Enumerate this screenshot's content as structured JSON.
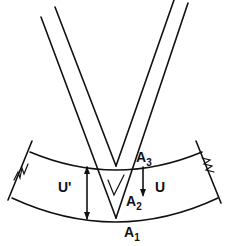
{
  "diagram": {
    "type": "indentation-geometry",
    "labels": {
      "a3": "A",
      "a3_sub": "3",
      "a2": "A",
      "a2_sub": "2",
      "a1": "A",
      "a1_sub": "1",
      "u": "U",
      "u_prime": "U'"
    },
    "colors": {
      "line": "#111111",
      "background": "#ffffff"
    }
  }
}
